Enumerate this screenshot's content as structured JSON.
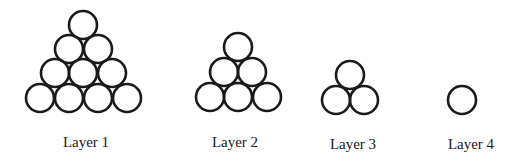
{
  "diagram": {
    "stroke_color": "#1a1a1a",
    "background": "#ffffff",
    "ball_radius": 14,
    "layers": [
      {
        "label": "Layer 1",
        "count": 10,
        "label_x": 86,
        "label_y": 147,
        "circles": [
          [
            83,
            25
          ],
          [
            69,
            49
          ],
          [
            98,
            49
          ],
          [
            55,
            73
          ],
          [
            83,
            73
          ],
          [
            112,
            73
          ],
          [
            40,
            98
          ],
          [
            69,
            98
          ],
          [
            98,
            98
          ],
          [
            127,
            98
          ]
        ]
      },
      {
        "label": "Layer 2",
        "count": 6,
        "label_x": 235,
        "label_y": 147,
        "circles": [
          [
            238,
            47
          ],
          [
            224,
            72
          ],
          [
            252,
            72
          ],
          [
            210,
            97
          ],
          [
            238,
            97
          ],
          [
            267,
            97
          ]
        ]
      },
      {
        "label": "Layer 3",
        "count": 3,
        "label_x": 353,
        "label_y": 149,
        "circles": [
          [
            350,
            75
          ],
          [
            336,
            100
          ],
          [
            364,
            100
          ]
        ]
      },
      {
        "label": "Layer 4",
        "count": 1,
        "label_x": 471,
        "label_y": 149,
        "circles": [
          [
            462,
            100
          ]
        ]
      }
    ]
  }
}
